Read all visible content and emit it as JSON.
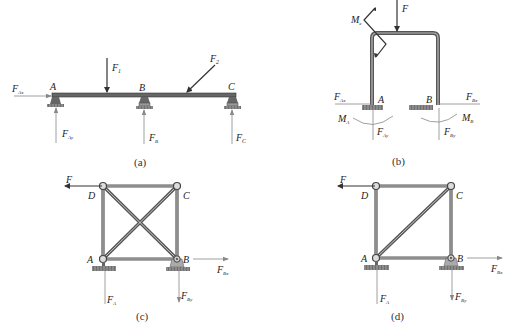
{
  "figures": {
    "a": {
      "caption": "(a)",
      "labels": {
        "A": "A",
        "B": "B",
        "C": "C",
        "F1": "F",
        "F1_sub": "1",
        "F2": "F",
        "F2_sub": "2",
        "FAx": "F",
        "FAx_sub": "Ax",
        "FAy": "F",
        "FAy_sub": "Ay",
        "FB": "F",
        "FB_sub": "B",
        "FC": "F",
        "FC_sub": "C"
      }
    },
    "b": {
      "caption": "(b)",
      "labels": {
        "A": "A",
        "B": "B",
        "F": "F",
        "Me": "M",
        "Me_sub": "e",
        "FAx": "F",
        "FAx_sub": "Ax",
        "FAy": "F",
        "FAy_sub": "Ay",
        "FBx": "F",
        "FBx_sub": "Bx",
        "FBy": "F",
        "FBy_sub": "By",
        "MA": "M",
        "MA_sub": "A",
        "MB": "M",
        "MB_sub": "B"
      }
    },
    "c": {
      "caption": "(c)",
      "labels": {
        "A": "A",
        "B": "B",
        "C": "C",
        "D": "D",
        "F": "F",
        "FA": "F",
        "FA_sub": "A",
        "FBx": "F",
        "FBx_sub": "Bx",
        "FBy": "F",
        "FBy_sub": "By"
      }
    },
    "d": {
      "caption": "(d)",
      "labels": {
        "A": "A",
        "B": "B",
        "C": "C",
        "D": "D",
        "F": "F",
        "FA": "F",
        "FA_sub": "A",
        "FBx": "F",
        "FBx_sub": "Bx",
        "FBy": "F",
        "FBy_sub": "By"
      }
    }
  },
  "colors": {
    "member": "#555555",
    "member_light": "#b0b0b0",
    "line": "#333333",
    "thin": "#888888",
    "ground": "#777777"
  }
}
